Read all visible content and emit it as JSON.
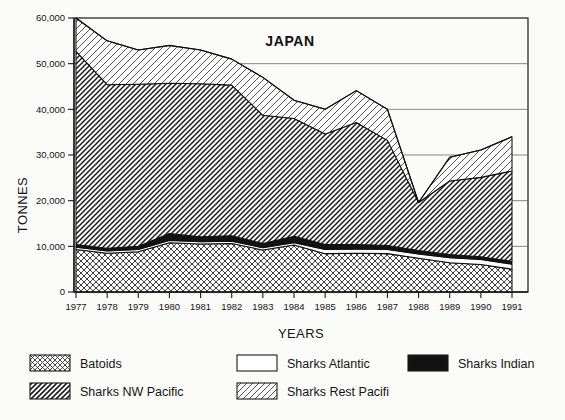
{
  "chart_data": {
    "type": "area",
    "title": "JAPAN",
    "xlabel": "YEARS",
    "ylabel": "TONNES",
    "grid": true,
    "stacked": true,
    "legend_position": "bottom",
    "categories": [
      1977,
      1978,
      1979,
      1980,
      1981,
      1982,
      1983,
      1984,
      1985,
      1986,
      1987,
      1988,
      1989,
      1990,
      1991
    ],
    "x": [
      "1977",
      "1978",
      "1979",
      "1980",
      "1981",
      "1982",
      "1983",
      "1984",
      "1985",
      "1986",
      "1987",
      "1988",
      "1989",
      "1990",
      "1991"
    ],
    "xlim": [
      1977,
      1991
    ],
    "ylim": [
      0,
      60000
    ],
    "yticks": [
      0,
      10000,
      20000,
      30000,
      40000,
      50000,
      60000
    ],
    "ytick_labels": [
      "0",
      "10,000",
      "20,000",
      "30,000",
      "40,000",
      "50,000",
      "60,000"
    ],
    "series": [
      {
        "name": "Batoids",
        "pattern": "crosshatch",
        "values": [
          9300,
          8500,
          8800,
          10800,
          10500,
          10600,
          9200,
          10300,
          8400,
          8500,
          8400,
          7400,
          6400,
          6000,
          5000
        ]
      },
      {
        "name": "Sharks Atlantic",
        "pattern": "white",
        "values": [
          500,
          500,
          500,
          500,
          500,
          500,
          500,
          500,
          900,
          900,
          900,
          900,
          1100,
          1100,
          1100
        ]
      },
      {
        "name": "Sharks Indian",
        "pattern": "solid-black",
        "values": [
          600,
          600,
          700,
          1500,
          1100,
          1200,
          900,
          1400,
          1100,
          1000,
          900,
          800,
          700,
          600,
          600
        ]
      },
      {
        "name": "Sharks NW Pacific",
        "pattern": "dense-diagonal",
        "values": [
          42300,
          35800,
          35500,
          32900,
          33500,
          33000,
          28100,
          25800,
          24200,
          26700,
          23000,
          10500,
          16100,
          17400,
          19800
        ]
      },
      {
        "name": "Sharks Rest Pacifi",
        "pattern": "light-diagonal",
        "values": [
          7300,
          9600,
          7500,
          8300,
          7400,
          5700,
          8300,
          4000,
          5400,
          7000,
          6800,
          0,
          5200,
          6000,
          7500
        ]
      }
    ],
    "totals": [
      60000,
      55000,
      53000,
      54000,
      53000,
      51000,
      47000,
      42000,
      40000,
      44100,
      40000,
      19600,
      29500,
      31100,
      34000
    ]
  },
  "legend": {
    "items": [
      {
        "label": "Batoids",
        "swatch": "crosshatch"
      },
      {
        "label": "Sharks Atlantic",
        "swatch": "white"
      },
      {
        "label": "Sharks Indian",
        "swatch": "solid-black"
      },
      {
        "label": "Sharks NW Pacific",
        "swatch": "dense-diagonal"
      },
      {
        "label": "Sharks Rest Pacifi",
        "swatch": "light-diagonal"
      }
    ]
  },
  "colors": {
    "ink": "#141414",
    "paper": "#fbfbf9",
    "grid": "#555555"
  }
}
